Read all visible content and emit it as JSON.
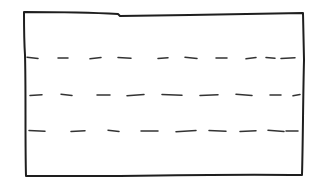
{
  "sketch": {
    "type": "hand-drawn wireframe",
    "subject": "text-block placeholder",
    "colors": {
      "ink": "#1e1e1e",
      "dash_ink": "#333333",
      "paper": "#ffffff"
    },
    "frame": {
      "corners": {
        "top_left": [
          24,
          12
        ],
        "top_right": [
          303,
          13
        ],
        "bottom_right": [
          302,
          175
        ],
        "bottom_left": [
          26,
          176
        ]
      }
    },
    "text_lines": [
      {
        "y": 58,
        "dashes": [
          [
            27,
            38
          ],
          [
            58,
            68
          ],
          [
            90,
            101
          ],
          [
            118,
            131
          ],
          [
            158,
            168
          ],
          [
            185,
            197
          ],
          [
            216,
            227
          ],
          [
            246,
            256
          ],
          [
            266,
            275
          ],
          [
            281,
            295
          ]
        ]
      },
      {
        "y": 95,
        "dashes": [
          [
            30,
            42
          ],
          [
            61,
            72
          ],
          [
            97,
            110
          ],
          [
            127,
            144
          ],
          [
            162,
            182
          ],
          [
            200,
            218
          ],
          [
            236,
            252
          ],
          [
            270,
            281
          ],
          [
            293,
            300
          ]
        ]
      },
      {
        "y": 131,
        "dashes": [
          [
            29,
            45
          ],
          [
            71,
            85
          ],
          [
            108,
            119
          ],
          [
            141,
            158
          ],
          [
            176,
            196
          ],
          [
            209,
            226
          ],
          [
            240,
            256
          ],
          [
            268,
            284
          ],
          [
            286,
            298
          ]
        ]
      }
    ]
  }
}
